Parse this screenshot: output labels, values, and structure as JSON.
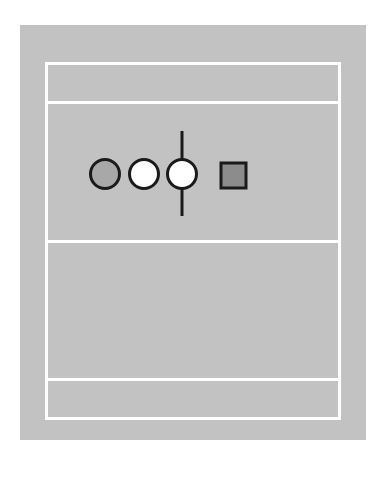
{
  "diagram": {
    "background_color": "#c2c2c2",
    "line_color": "#ffffff",
    "sections": [
      {
        "name": "top-band"
      },
      {
        "name": "symbol-band"
      },
      {
        "name": "empty-band"
      },
      {
        "name": "bottom-band"
      }
    ],
    "symbols": [
      {
        "type": "circle",
        "fill": "#a8a8a8",
        "label": "gray-circle"
      },
      {
        "type": "circle",
        "fill": "#ffffff",
        "label": "white-circle"
      },
      {
        "type": "circle-with-vertical-line",
        "fill": "#ffffff",
        "label": "white-circle-crossed"
      },
      {
        "type": "square",
        "fill": "#8c8c8c",
        "label": "gray-square"
      }
    ]
  }
}
